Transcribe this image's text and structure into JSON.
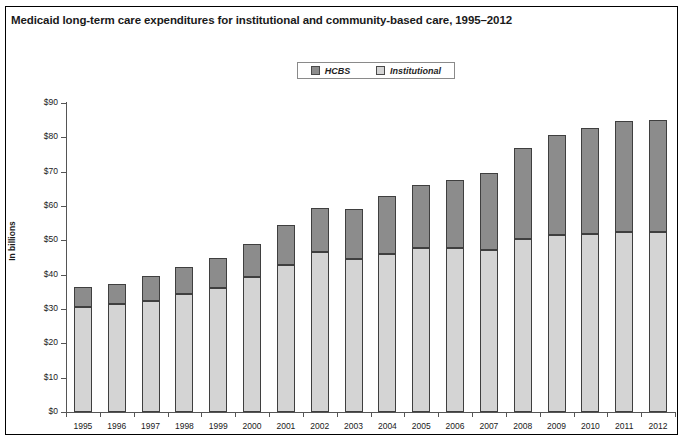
{
  "figure": {
    "title": "Medicaid long-term care expenditures for institutional and community-based care, 1995–2012"
  },
  "legend": {
    "position": "top-center",
    "entries": [
      {
        "label": "HCBS",
        "color": "#8c8c8c"
      },
      {
        "label": "Institutional",
        "color": "#d4d4d4"
      }
    ]
  },
  "colors": {
    "hcbs": "#8c8c8c",
    "institutional": "#d4d4d4",
    "bar_outline": "#3f3f3f",
    "axis": "#555555",
    "frame": "#000000",
    "text": "#1a1a1a"
  },
  "chart_data": {
    "type": "bar",
    "stacked": true,
    "title": "Medicaid long-term care expenditures for institutional and community-based care, 1995–2012",
    "xlabel": "",
    "ylabel": "In billions",
    "ylim": [
      0,
      90
    ],
    "ytick_step": 10,
    "ytick_labels": [
      "$90",
      "$80",
      "$70",
      "$60",
      "$50",
      "$40",
      "$30",
      "$20",
      "$10",
      "$0"
    ],
    "ytick_values": [
      90,
      80,
      70,
      60,
      50,
      40,
      30,
      20,
      10,
      0
    ],
    "grid": false,
    "legend_position": "top-center",
    "categories": [
      "1995",
      "1996",
      "1997",
      "1998",
      "1999",
      "2000",
      "2001",
      "2002",
      "2003",
      "2004",
      "2005",
      "2006",
      "2007",
      "2008",
      "2009",
      "2010",
      "2011",
      "2012"
    ],
    "series": [
      {
        "name": "Institutional",
        "color": "#d4d4d4",
        "values": [
          30.7,
          31.6,
          32.4,
          34.4,
          36.2,
          39.4,
          42.9,
          46.5,
          44.6,
          45.9,
          47.7,
          47.9,
          47.2,
          50.4,
          51.7,
          51.9,
          52.4,
          52.3
        ]
      },
      {
        "name": "HCBS",
        "color": "#8c8c8c",
        "values": [
          5.8,
          5.8,
          7.2,
          7.8,
          8.8,
          9.5,
          11.6,
          13.0,
          14.5,
          17.1,
          18.5,
          19.7,
          22.4,
          26.6,
          28.9,
          30.8,
          32.5,
          32.7
        ]
      }
    ],
    "totals": [
      36.5,
      37.4,
      39.6,
      42.2,
      45.0,
      48.9,
      54.5,
      59.5,
      59.1,
      63.0,
      66.2,
      67.6,
      69.6,
      77.0,
      80.6,
      82.7,
      84.9,
      85.0
    ]
  }
}
